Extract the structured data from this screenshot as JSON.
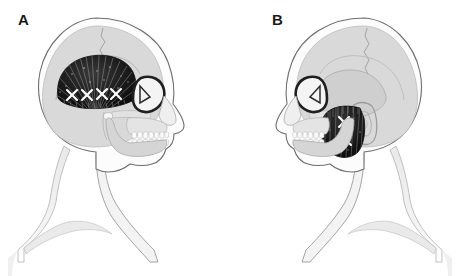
{
  "figure": {
    "type": "anatomical-illustration",
    "background_color": "#ffffff",
    "width": 460,
    "height": 276
  },
  "panels": [
    {
      "id": "A",
      "label": "A",
      "orientation": "facing-right",
      "muscle": {
        "name": "temporalis",
        "region": "temporal fossa",
        "fill_color": "#141414",
        "fiber_pattern": "radiating-fan-striations",
        "trigger_point_count": 4,
        "trigger_point_marker": "X",
        "trigger_point_color": "#ffffff",
        "trigger_points": [
          {
            "x": 72,
            "y": 95
          },
          {
            "x": 87,
            "y": 95
          },
          {
            "x": 102,
            "y": 94
          },
          {
            "x": 116,
            "y": 94
          }
        ]
      }
    },
    {
      "id": "B",
      "label": "B",
      "orientation": "facing-left",
      "muscle": {
        "name": "masseter",
        "region": "mandibular ramus",
        "fill_color": "#141414",
        "fiber_pattern": "vertical-striations",
        "trigger_point_count": 2,
        "trigger_point_marker": "X",
        "trigger_point_color": "#ffffff",
        "trigger_points": [
          {
            "x": 116,
            "y": 122
          },
          {
            "x": 114,
            "y": 140
          }
        ]
      }
    }
  ],
  "anatomy_parts": [
    {
      "name": "scalp-soft-tissue-outline",
      "color": "#6e6e6e"
    },
    {
      "name": "cranial-vault",
      "color": "#d6d6d6"
    },
    {
      "name": "coronal-suture",
      "color": "#9a9a9a"
    },
    {
      "name": "temporal-bone",
      "color": "#c9c9c9"
    },
    {
      "name": "orbit",
      "color": "#1f1f1f"
    },
    {
      "name": "nasal-profile",
      "color": "#8a8a8a"
    },
    {
      "name": "maxillary-teeth",
      "color": "#fafafa"
    },
    {
      "name": "mandibular-teeth",
      "color": "#fafafa"
    },
    {
      "name": "mandible",
      "color": "#d0d0d0"
    },
    {
      "name": "ear-auricle",
      "color": "#b4b4b4"
    },
    {
      "name": "neck",
      "color": "#ededed"
    },
    {
      "name": "shoulder",
      "color": "#f2f2f2"
    },
    {
      "name": "clavicle",
      "color": "#e4e4e4"
    }
  ],
  "colors": {
    "background": "#ffffff",
    "label_text": "#1a1a1a",
    "muscle_dark": "#141414",
    "trigger_point": "#ffffff",
    "bone_light": "#d6d6d6",
    "soft_tissue_outline": "#6e6e6e"
  }
}
